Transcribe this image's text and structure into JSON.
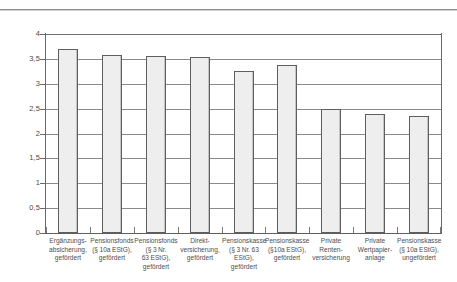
{
  "chart_data": {
    "type": "bar",
    "title": "",
    "xlabel": "",
    "ylabel": "",
    "ylim": [
      0,
      4
    ],
    "ytick_step": 0.5,
    "grid": true,
    "legend": false,
    "decimal_separator": ",",
    "ytick_labels": [
      "0",
      "0,5",
      "1",
      "1,5",
      "2",
      "2,5",
      "3",
      "3,5",
      "4"
    ],
    "ytick_values": [
      0,
      0.5,
      1,
      1.5,
      2,
      2.5,
      3,
      3.5,
      4
    ],
    "categories": [
      "Ergänzungsabsicherung, gefördert",
      "Pensionsfonds (§ 10a EStG), gefördert",
      "Pensionsfonds (§ 3 Nr. 63 EStG), gefördert",
      "Direktversicherung, gefördert",
      "Pensionskasse (§ 3 Nr. 63 EStG), gefördert",
      "Pensionskasse (§10a EStG), gefördert",
      "Private Rentenversicherung",
      "Private Wertpapieranlage",
      "Pensionskasse (§ 10a EStG), ungefördert"
    ],
    "category_lines": [
      [
        "Ergänzungs-",
        "absicherung,",
        "gefördert"
      ],
      [
        "Pensionsfonds",
        "(§ 10a EStG),",
        "gefördert"
      ],
      [
        "Pensionsfonds",
        "(§ 3 Nr.",
        "63 EStG),",
        "gefördert"
      ],
      [
        "Direkt-",
        "versicherung,",
        "gefördert"
      ],
      [
        "Pensionskasse",
        "(§ 3 Nr. 63",
        "EStG),",
        "gefördert"
      ],
      [
        "Pensionskasse",
        "(§10a EStG),",
        "gefördert"
      ],
      [
        "Private",
        "Renten-",
        "versicherung"
      ],
      [
        "Private",
        "Wertpapier-",
        "anlage"
      ],
      [
        "Pensionskasse",
        "(§ 10a EStG),",
        "ungefördert"
      ]
    ],
    "values": [
      3.7,
      3.57,
      3.55,
      3.53,
      3.25,
      3.38,
      2.5,
      2.4,
      2.35
    ],
    "bar_fill_color": "#eeeeee",
    "bar_border_color": "#5e5e5e",
    "axis_color": "#6a6a6a",
    "gridline_color": "#6f6f6f",
    "text_color": "#4e4e4e"
  }
}
